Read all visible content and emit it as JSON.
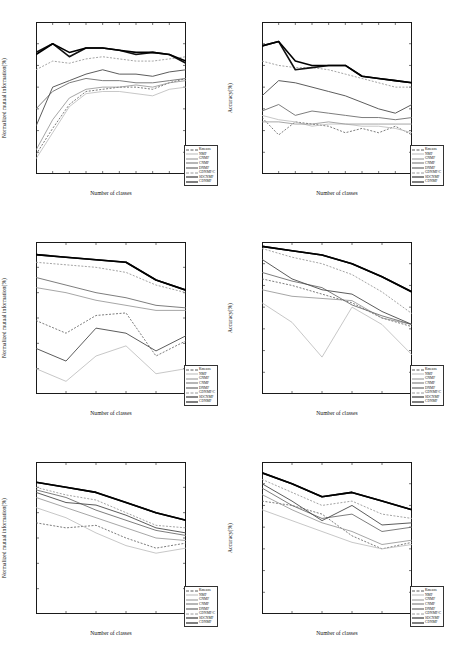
{
  "figure": {
    "layout": "2 columns x 3 rows",
    "xlabel": "Number of classes",
    "ylabel_left": "Normalized mutual information(%)",
    "ylabel_right": "Accuracy(%)"
  },
  "legend": {
    "entries": [
      {
        "label": "Kmeans",
        "color": "#5a5a5a",
        "dash": "2,1.5",
        "width": 0.8
      },
      {
        "label": "NMF",
        "color": "#b9b9b9",
        "dash": "0",
        "width": 0.8
      },
      {
        "label": "GNMF",
        "color": "#8f8f8f",
        "dash": "0",
        "width": 0.8
      },
      {
        "label": "CNMF",
        "color": "#6e6e6e",
        "dash": "0",
        "width": 0.9
      },
      {
        "label": "DNMF",
        "color": "#4a4a4a",
        "dash": "0",
        "width": 0.9
      },
      {
        "label": "GDNMF/C",
        "color": "#9a9a9a",
        "dash": "2,1.5",
        "width": 0.9
      },
      {
        "label": "SDCNMF",
        "color": "#111111",
        "dash": "0",
        "width": 1.6
      },
      {
        "label": "CDNMF",
        "color": "#000000",
        "dash": "0",
        "width": 1.6
      }
    ]
  },
  "chart_data": [
    {
      "type": "line",
      "panel": "top-left",
      "title": "",
      "xlabel": "Number of classes",
      "ylabel": "Normalized mutual information(%)",
      "xlim": [
        2,
        20
      ],
      "ylim": [
        20,
        90
      ],
      "xticks": [
        2,
        4,
        6,
        8,
        10,
        12,
        14,
        16,
        18,
        20
      ],
      "yticks": [
        20,
        30,
        40,
        50,
        60,
        70,
        80,
        90
      ],
      "grid": false,
      "legend_position": "lower-right",
      "x": [
        2,
        4,
        6,
        8,
        10,
        12,
        14,
        16,
        18,
        20
      ],
      "series": [
        {
          "name": "Kmeans",
          "values": [
            29,
            41,
            52,
            58,
            59,
            60,
            60,
            59,
            62,
            64
          ]
        },
        {
          "name": "NMF",
          "values": [
            27,
            39,
            51,
            57,
            58,
            58,
            57,
            56,
            59,
            60
          ]
        },
        {
          "name": "GNMF",
          "values": [
            31,
            45,
            55,
            59,
            60,
            60,
            61,
            60,
            62,
            63
          ]
        },
        {
          "name": "CNMF",
          "values": [
            50,
            58,
            62,
            64,
            63,
            63,
            62,
            62,
            63,
            64
          ]
        },
        {
          "name": "DNMF",
          "values": [
            42,
            60,
            63,
            66,
            68,
            66,
            66,
            65,
            67,
            68
          ]
        },
        {
          "name": "GDNMF/C",
          "values": [
            68,
            72,
            71,
            73,
            74,
            73,
            72,
            72,
            73,
            74
          ]
        },
        {
          "name": "SDCNMF",
          "values": [
            76,
            80,
            74,
            78,
            78,
            77,
            75,
            76,
            75,
            71
          ]
        },
        {
          "name": "CDNMF",
          "values": [
            75,
            80,
            76,
            78,
            78,
            77,
            76,
            76,
            75,
            72
          ]
        }
      ]
    },
    {
      "type": "line",
      "panel": "top-right",
      "title": "",
      "xlabel": "Number of classes",
      "ylabel": "Accuracy(%)",
      "xlim": [
        2,
        20
      ],
      "ylim": [
        20,
        90
      ],
      "xticks": [
        2,
        4,
        6,
        8,
        10,
        12,
        14,
        16,
        18,
        20
      ],
      "yticks": [
        20,
        30,
        40,
        50,
        60,
        70,
        80,
        90
      ],
      "grid": false,
      "legend_position": "lower-right",
      "x": [
        2,
        4,
        6,
        8,
        10,
        12,
        14,
        16,
        18,
        20
      ],
      "series": [
        {
          "name": "Kmeans",
          "values": [
            46,
            38,
            44,
            43,
            42,
            39,
            41,
            39,
            42,
            38
          ]
        },
        {
          "name": "NMF",
          "values": [
            47,
            45,
            44,
            42,
            43,
            43,
            42,
            42,
            41,
            39
          ]
        },
        {
          "name": "GNMF",
          "values": [
            44,
            44,
            43,
            43,
            44,
            43,
            43,
            43,
            43,
            43
          ]
        },
        {
          "name": "CNMF",
          "values": [
            49,
            52,
            47,
            49,
            48,
            47,
            46,
            46,
            45,
            46
          ]
        },
        {
          "name": "DNMF",
          "values": [
            56,
            63,
            62,
            60,
            58,
            56,
            53,
            50,
            48,
            52
          ]
        },
        {
          "name": "GDNMF/C",
          "values": [
            72,
            70,
            69,
            69,
            68,
            66,
            64,
            62,
            60,
            60
          ]
        },
        {
          "name": "SDCNMF",
          "values": [
            79,
            81,
            68,
            69,
            70,
            70,
            65,
            64,
            63,
            62
          ]
        },
        {
          "name": "CDNMF",
          "values": [
            79,
            81,
            72,
            70,
            70,
            70,
            65,
            64,
            63,
            62
          ]
        }
      ]
    },
    {
      "type": "line",
      "panel": "middle-left",
      "title": "",
      "xlabel": "Number of classes",
      "ylabel": "Normalized mutual information(%)",
      "xlim": [
        2,
        12
      ],
      "ylim": [
        20,
        80
      ],
      "xticks": [
        2,
        4,
        6,
        8,
        10,
        12
      ],
      "yticks": [
        20,
        30,
        40,
        50,
        60,
        70,
        80
      ],
      "grid": false,
      "legend_position": "lower-right",
      "x": [
        2,
        4,
        6,
        8,
        10,
        12
      ],
      "series": [
        {
          "name": "Kmeans",
          "values": [
            49,
            44,
            51,
            52,
            35,
            41
          ]
        },
        {
          "name": "NMF",
          "values": [
            30,
            25,
            35,
            39,
            28,
            30
          ]
        },
        {
          "name": "GNMF",
          "values": [
            62,
            60,
            57,
            55,
            53,
            53
          ]
        },
        {
          "name": "CNMF",
          "values": [
            66,
            63,
            60,
            58,
            55,
            54
          ]
        },
        {
          "name": "DNMF",
          "values": [
            38,
            33,
            46,
            44,
            37,
            43
          ]
        },
        {
          "name": "GDNMF/C",
          "values": [
            72,
            71,
            70,
            68,
            63,
            60
          ]
        },
        {
          "name": "SDCNMF",
          "values": [
            75,
            74,
            73,
            72,
            65,
            61
          ]
        },
        {
          "name": "CDNMF",
          "values": [
            75,
            74,
            73,
            72,
            65,
            61
          ]
        }
      ]
    },
    {
      "type": "line",
      "panel": "middle-right",
      "title": "",
      "xlabel": "Number of classes",
      "ylabel": "Accuracy(%)",
      "xlim": [
        2,
        12
      ],
      "ylim": [
        20,
        90
      ],
      "xticks": [
        2,
        4,
        6,
        8,
        10,
        12
      ],
      "yticks": [
        20,
        30,
        40,
        50,
        60,
        70,
        80,
        90
      ],
      "grid": false,
      "legend_position": "lower-right",
      "x": [
        2,
        4,
        6,
        8,
        10,
        12
      ],
      "series": [
        {
          "name": "Kmeans",
          "values": [
            73,
            70,
            66,
            62,
            55,
            51
          ]
        },
        {
          "name": "NMF",
          "values": [
            62,
            53,
            37,
            60,
            52,
            38
          ]
        },
        {
          "name": "GNMF",
          "values": [
            68,
            65,
            64,
            63,
            55,
            52
          ]
        },
        {
          "name": "CNMF",
          "values": [
            76,
            72,
            69,
            61,
            56,
            52
          ]
        },
        {
          "name": "DNMF",
          "values": [
            82,
            73,
            68,
            66,
            58,
            52
          ]
        },
        {
          "name": "GDNMF/C",
          "values": [
            87,
            83,
            80,
            75,
            67,
            57
          ]
        },
        {
          "name": "SDCNMF",
          "values": [
            88,
            86,
            84,
            80,
            74,
            67
          ]
        },
        {
          "name": "CDNMF",
          "values": [
            88,
            86,
            84,
            80,
            74,
            67
          ]
        }
      ]
    },
    {
      "type": "line",
      "panel": "bottom-left",
      "title": "",
      "xlabel": "Number of classes",
      "ylabel": "Normalized mutual information(%)",
      "xlim": [
        2,
        12
      ],
      "ylim": [
        20,
        80
      ],
      "xticks": [
        2,
        4,
        6,
        8,
        10,
        12
      ],
      "yticks": [
        20,
        30,
        40,
        50,
        60,
        70,
        80
      ],
      "grid": false,
      "legend_position": "lower-right",
      "x": [
        2,
        4,
        6,
        8,
        10,
        12
      ],
      "series": [
        {
          "name": "Kmeans",
          "values": [
            56,
            54,
            55,
            50,
            46,
            48
          ]
        },
        {
          "name": "NMF",
          "values": [
            62,
            58,
            52,
            47,
            44,
            46
          ]
        },
        {
          "name": "GNMF",
          "values": [
            66,
            62,
            58,
            54,
            50,
            49
          ]
        },
        {
          "name": "CNMF",
          "values": [
            69,
            66,
            61,
            57,
            53,
            51
          ]
        },
        {
          "name": "DNMF",
          "values": [
            68,
            64,
            63,
            59,
            54,
            52
          ]
        },
        {
          "name": "GDNMF/C",
          "values": [
            70,
            67,
            65,
            60,
            55,
            54
          ]
        },
        {
          "name": "SDCNMF",
          "values": [
            72,
            70,
            68,
            64,
            60,
            57
          ]
        },
        {
          "name": "CDNMF",
          "values": [
            72,
            70,
            68,
            64,
            60,
            57
          ]
        }
      ]
    },
    {
      "type": "line",
      "panel": "bottom-right",
      "title": "",
      "xlabel": "Number of classes",
      "ylabel": "Accuracy(%)",
      "xlim": [
        2,
        12
      ],
      "ylim": [
        20,
        90
      ],
      "xticks": [
        2,
        4,
        6,
        8,
        10,
        12
      ],
      "yticks": [
        20,
        30,
        40,
        50,
        60,
        70,
        80,
        90
      ],
      "grid": false,
      "legend_position": "lower-right",
      "x": [
        2,
        4,
        6,
        8,
        10,
        12
      ],
      "series": [
        {
          "name": "Kmeans",
          "values": [
            72,
            70,
            66,
            56,
            50,
            53
          ]
        },
        {
          "name": "NMF",
          "values": [
            68,
            63,
            58,
            53,
            50,
            52
          ]
        },
        {
          "name": "GNMF",
          "values": [
            75,
            68,
            62,
            58,
            52,
            54
          ]
        },
        {
          "name": "CNMF",
          "values": [
            78,
            70,
            64,
            66,
            58,
            60
          ]
        },
        {
          "name": "DNMF",
          "values": [
            80,
            72,
            63,
            70,
            61,
            62
          ]
        },
        {
          "name": "GDNMF/C",
          "values": [
            82,
            76,
            70,
            72,
            66,
            64
          ]
        },
        {
          "name": "SDCNMF",
          "values": [
            85,
            80,
            74,
            76,
            72,
            68
          ]
        },
        {
          "name": "CDNMF",
          "values": [
            85,
            80,
            74,
            76,
            72,
            68
          ]
        }
      ]
    }
  ]
}
